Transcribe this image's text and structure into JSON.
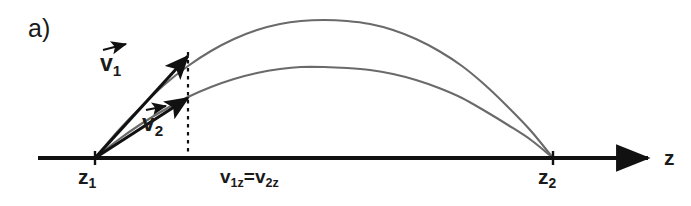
{
  "figure": {
    "panel_letter": "a)",
    "background_color": "#ffffff",
    "axis_color": "#111111",
    "trajectory_color": "#6a6a6a",
    "vector_color": "#111111",
    "dashed_guide_color": "#111111"
  },
  "axis": {
    "name": "z-axis",
    "label": "z",
    "arrow_direction": "right",
    "start_x": 38,
    "end_x": 648,
    "y": 158,
    "ticks": [
      {
        "label": "z",
        "sub": "1",
        "x": 95
      },
      {
        "label": "z",
        "sub": "2",
        "x": 553
      }
    ]
  },
  "labels": {
    "z1": {
      "base": "z",
      "sub": "1",
      "full": "z1"
    },
    "z2": {
      "base": "z",
      "sub": "2",
      "full": "z2"
    },
    "axis_z": "z",
    "equality": {
      "full": "v1z=v2z",
      "left_base": "v",
      "left_sub": "1z",
      "operator": "=",
      "right_base": "v",
      "right_sub": "2z"
    }
  },
  "vectors": [
    {
      "name": "v1",
      "base": "v",
      "sub": "1",
      "has_arrow_accent": true,
      "origin": {
        "x": 95,
        "y": 158
      },
      "tip": {
        "x": 188,
        "y": 56
      },
      "label_position": {
        "x": 100,
        "y": 52
      }
    },
    {
      "name": "v2",
      "base": "v",
      "sub": "2",
      "has_arrow_accent": true,
      "origin": {
        "x": 95,
        "y": 158
      },
      "tip": {
        "x": 188,
        "y": 98
      },
      "label_position": {
        "x": 142,
        "y": 112
      }
    }
  ],
  "dashed_guide": {
    "name": "vertical-dashed-guide",
    "x": 188,
    "y_top": 52,
    "y_bottom": 158
  },
  "chart_data": {
    "type": "line",
    "title": "a)",
    "xlabel": "z",
    "ylabel": "",
    "grid": false,
    "legend": null,
    "xlim": [
      38,
      648
    ],
    "ylim": [
      0,
      206
    ],
    "annotations": [
      {
        "text": "v1z=v2z",
        "x": 283,
        "y": 177
      },
      {
        "text": "z1",
        "x": 95,
        "y": 176
      },
      {
        "text": "z2",
        "x": 553,
        "y": 176
      },
      {
        "text": "v1",
        "x": 112,
        "y": 64
      },
      {
        "text": "v2",
        "x": 154,
        "y": 124
      },
      {
        "text": "z",
        "x": 670,
        "y": 157
      },
      {
        "text": "a)",
        "x": 38,
        "y": 28
      }
    ],
    "series": [
      {
        "name": "trajectory-1-steep",
        "color": "#6a6a6a",
        "launch_point": [
          95,
          158
        ],
        "landing_point": [
          553,
          158
        ],
        "apex": [
          324,
          20
        ],
        "apex_height_px": 138,
        "points": [
          [
            95,
            158
          ],
          [
            118,
            131
          ],
          [
            141,
            107
          ],
          [
            164,
            85
          ],
          [
            188,
            66
          ],
          [
            211,
            51
          ],
          [
            234,
            39
          ],
          [
            257,
            30
          ],
          [
            280,
            24
          ],
          [
            301,
            21
          ],
          [
            324,
            20
          ],
          [
            347,
            21
          ],
          [
            370,
            24
          ],
          [
            393,
            30
          ],
          [
            416,
            39
          ],
          [
            439,
            51
          ],
          [
            462,
            66
          ],
          [
            485,
            85
          ],
          [
            508,
            107
          ],
          [
            531,
            131
          ],
          [
            553,
            158
          ]
        ]
      },
      {
        "name": "trajectory-2-shallow",
        "color": "#6a6a6a",
        "launch_point": [
          95,
          158
        ],
        "landing_point": [
          553,
          158
        ],
        "apex": [
          324,
          67
        ],
        "apex_height_px": 91,
        "points": [
          [
            95,
            158
          ],
          [
            118,
            140
          ],
          [
            141,
            124
          ],
          [
            164,
            110
          ],
          [
            188,
            97
          ],
          [
            211,
            87
          ],
          [
            234,
            79
          ],
          [
            257,
            73
          ],
          [
            280,
            69
          ],
          [
            301,
            67
          ],
          [
            324,
            67
          ],
          [
            347,
            68
          ],
          [
            370,
            70
          ],
          [
            393,
            74
          ],
          [
            416,
            80
          ],
          [
            439,
            88
          ],
          [
            462,
            98
          ],
          [
            485,
            111
          ],
          [
            508,
            125
          ],
          [
            531,
            140
          ],
          [
            553,
            158
          ]
        ]
      }
    ],
    "vectors": [
      {
        "name": "v1",
        "from": [
          95,
          158
        ],
        "to": [
          188,
          56
        ]
      },
      {
        "name": "v2",
        "from": [
          95,
          158
        ],
        "to": [
          188,
          98
        ]
      }
    ]
  }
}
